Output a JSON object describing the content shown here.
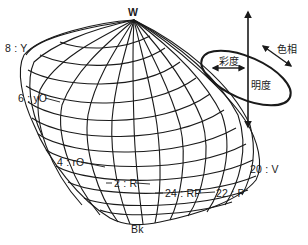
{
  "diagram": {
    "type": "color_solid",
    "apex_top_label": "W",
    "apex_bottom_label": "Bk",
    "hue_labels": [
      {
        "label": "8 : Y"
      },
      {
        "label": "6 : yO"
      },
      {
        "label": "4 : rO"
      },
      {
        "label": "2 : R"
      },
      {
        "label": "24 : RP"
      },
      {
        "label": "22 : P"
      },
      {
        "label": "20 : V"
      }
    ],
    "legend": {
      "chroma_label": "彩度",
      "lightness_label": "明度",
      "hue_label": "色相"
    },
    "colors": {
      "line": "#1a1a1a",
      "background": "#ffffff"
    }
  }
}
